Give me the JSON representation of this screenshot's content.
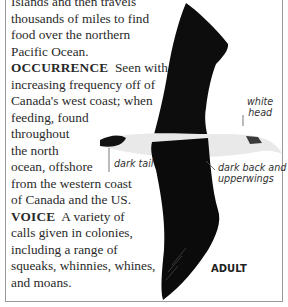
{
  "body_text": {
    "lines_intro": [
      "Islands and then travels",
      "thousands of miles to find",
      "food over the northern",
      "Pacific Ocean."
    ],
    "occurrence": {
      "heading": "OCCURRENCE",
      "lines": [
        "Seen with",
        "increasing frequency off of",
        "Canada's west coast; when",
        "feeding, found",
        "throughout",
        "the north",
        "ocean, offshore",
        "from the western coast",
        "of Canada and the US."
      ]
    },
    "voice": {
      "heading": "VOICE",
      "lines": [
        "A variety of",
        "calls given in colonies,",
        "including a range of",
        "squeaks, whinnies, whines,",
        "and moans."
      ]
    }
  },
  "illustration": {
    "subject": "albatross in flight (top view)",
    "annotations": {
      "white_head": [
        "white",
        "head"
      ],
      "dark_tail": "dark tail",
      "dark_back": [
        "dark back and",
        "upperwings"
      ]
    },
    "age_label": "ADULT"
  }
}
